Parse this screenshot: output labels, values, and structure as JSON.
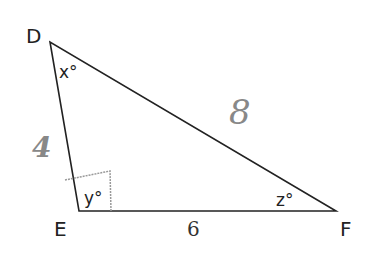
{
  "diagram": {
    "type": "triangle",
    "vertices": {
      "D": {
        "label": "D",
        "x": 50,
        "y": 42
      },
      "E": {
        "label": "E",
        "x": 79,
        "y": 211
      },
      "F": {
        "label": "F",
        "x": 336,
        "y": 211
      }
    },
    "angles": {
      "D": "x°",
      "E": "y°",
      "F": "z°"
    },
    "sides": {
      "DE": "4",
      "DF": "8",
      "EF": "6"
    },
    "right_angle_mark": "E",
    "colors": {
      "stroke": "#222222",
      "handwritten": "#888888",
      "right_angle_mark": "#999999"
    }
  }
}
